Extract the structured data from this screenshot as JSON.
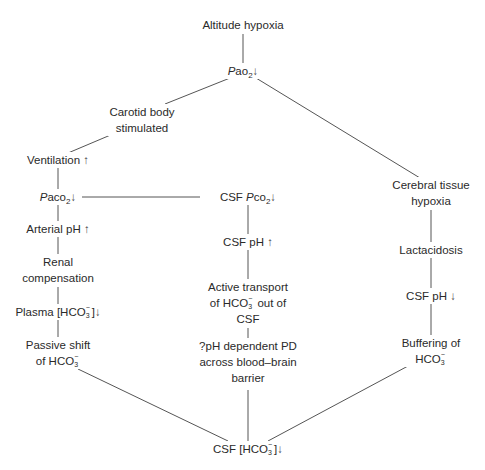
{
  "diagram": {
    "type": "flowchart",
    "nodes": {
      "altitude_hypoxia": {
        "label": "Altitude hypoxia"
      },
      "pao2": {
        "prefix": "P",
        "main": "ao",
        "sub": "2",
        "arrow": "↓"
      },
      "carotid": {
        "line1": "Carotid body",
        "line2": "stimulated"
      },
      "ventilation": {
        "label": "Ventilation",
        "arrow": "↑"
      },
      "cerebral": {
        "line1": "Cerebral tissue",
        "line2": "hypoxia"
      },
      "paco2": {
        "prefix": "P",
        "main": "aco",
        "sub": "2",
        "arrow": "↓"
      },
      "csf_pco2": {
        "label": "CSF ",
        "prefix": "P",
        "main": "co",
        "sub": "2",
        "arrow": "↓"
      },
      "arterial_ph": {
        "label": "Arterial pH",
        "arrow": "↑"
      },
      "csf_ph_up": {
        "label": "CSF pH",
        "arrow": "↑"
      },
      "lactacidosis": {
        "label": "Lactacidosis"
      },
      "renal": {
        "line1": "Renal",
        "line2": "compensation"
      },
      "active_transport": {
        "line1": "Active transport",
        "line2a": "of HCO",
        "line2b": " out of",
        "line3": "CSF"
      },
      "csf_ph_down": {
        "label": "CSF pH",
        "arrow": "↓"
      },
      "plasma": {
        "pre": "Plasma [HCO",
        "post": "]",
        "arrow": "↓"
      },
      "passive": {
        "line1": "Passive shift",
        "line2": "of HCO"
      },
      "ph_pd": {
        "line1": "?pH dependent PD",
        "line2": "across blood–brain",
        "line3": "barrier"
      },
      "buffering": {
        "line1": "Buffering of",
        "line2": "HCO"
      },
      "csf_hco3": {
        "pre": "CSF [HCO",
        "post": "]",
        "arrow": "↓"
      }
    },
    "ion": {
      "sup": "−",
      "sub": "3"
    },
    "edges": [
      [
        "altitude_hypoxia",
        "pao2"
      ],
      [
        "pao2",
        "carotid"
      ],
      [
        "pao2",
        "cerebral"
      ],
      [
        "carotid",
        "ventilation"
      ],
      [
        "ventilation",
        "paco2"
      ],
      [
        "paco2",
        "csf_pco2"
      ],
      [
        "paco2",
        "arterial_ph"
      ],
      [
        "arterial_ph",
        "renal"
      ],
      [
        "renal",
        "plasma"
      ],
      [
        "plasma",
        "passive"
      ],
      [
        "passive",
        "csf_hco3"
      ],
      [
        "csf_pco2",
        "csf_ph_up"
      ],
      [
        "csf_ph_up",
        "active_transport"
      ],
      [
        "active_transport",
        "ph_pd"
      ],
      [
        "ph_pd",
        "csf_hco3"
      ],
      [
        "cerebral",
        "lactacidosis"
      ],
      [
        "lactacidosis",
        "csf_ph_down"
      ],
      [
        "csf_ph_down",
        "buffering"
      ],
      [
        "buffering",
        "csf_hco3"
      ]
    ]
  }
}
